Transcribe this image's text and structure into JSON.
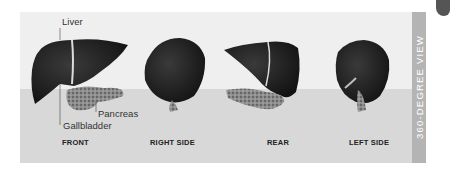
{
  "title": "360-DEGREE VIEW",
  "annotations": {
    "liver": "Liver",
    "pancreas": "Pancreas",
    "gallbladder": "Gallbladder"
  },
  "views": [
    {
      "label": "FRONT"
    },
    {
      "label": "RIGHT SIDE"
    },
    {
      "label": "REAR"
    },
    {
      "label": "LEFT SIDE"
    }
  ],
  "colors": {
    "panel_top": "#efefef",
    "panel_bottom": "#d8d8d8",
    "strip": "#b4b4b4",
    "organ": "#1e1e1e",
    "pancreas": "#8a8a8a"
  }
}
